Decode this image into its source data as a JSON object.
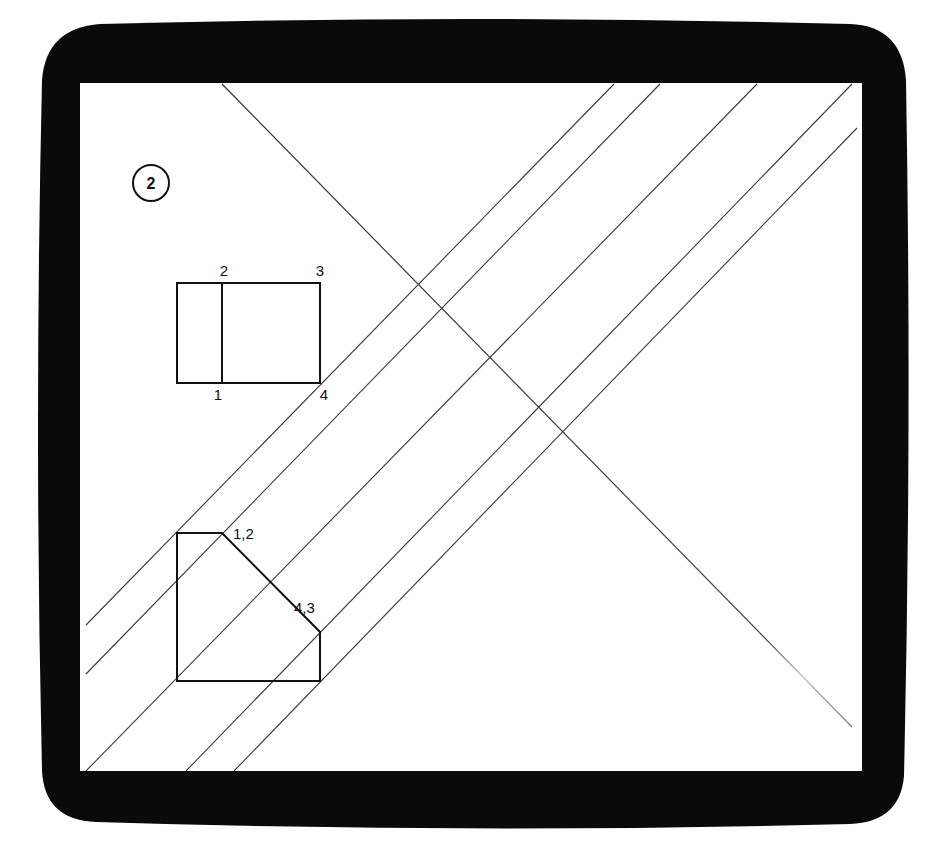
{
  "figure": {
    "badge_number": "2",
    "colors": {
      "frame": "#0a0a0a",
      "screen": "#ffffff",
      "thin_line": "#3a3a3a",
      "thick_line": "#111111",
      "text": "#111111"
    }
  },
  "elevation_view": {
    "labels": {
      "p2": "2",
      "p3": "3",
      "p1": "1",
      "p4": "4"
    }
  },
  "projected_view": {
    "labels": {
      "p12": "1,2",
      "p43": "4,3"
    }
  }
}
